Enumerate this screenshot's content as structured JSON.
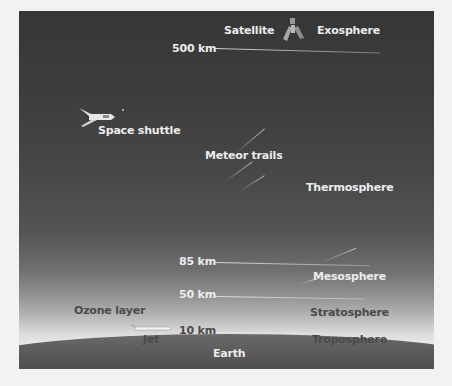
{
  "diagram": {
    "altitudes": [
      {
        "label": "500 km"
      },
      {
        "label": "85 km"
      },
      {
        "label": "50 km"
      },
      {
        "label": "10 km"
      }
    ],
    "layers": [
      {
        "name": "Exosphere"
      },
      {
        "name": "Thermosphere"
      },
      {
        "name": "Mesosphere"
      },
      {
        "name": "Stratosphere"
      },
      {
        "name": "Troposphere"
      }
    ],
    "objects": {
      "satellite": "Satellite",
      "space_shuttle": "Space shuttle",
      "meteor_trails": "Meteor trails",
      "ozone_layer": "Ozone layer",
      "jet": "Jet",
      "earth": "Earth"
    },
    "icons": {
      "satellite": "satellite-icon",
      "space_shuttle": "space-shuttle-icon",
      "jet": "jet-plane-icon"
    },
    "colors": {
      "sky_top": "#363636",
      "sky_horizon": "#eaeaea",
      "earth": "#4d4d4d",
      "label_light": "#ececec",
      "label_dark": "#4a4a4a",
      "page_background": "#f2f2f0"
    }
  }
}
